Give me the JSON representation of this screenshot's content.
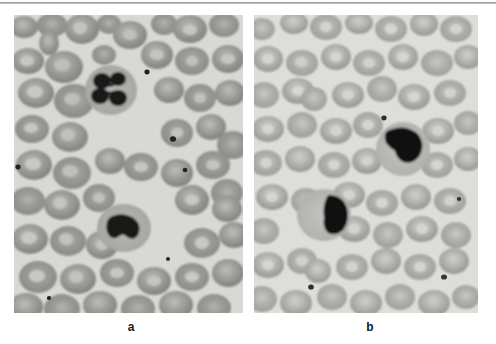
{
  "figure": {
    "name": "blood-smear-figure",
    "type": "two-panel-photomicrograph",
    "divider_rule": true,
    "background_color": "#ffffff",
    "rule_color": "#9a9a9a"
  },
  "panels": [
    {
      "id": "a",
      "caption": "a",
      "label_name": "panel-label-a",
      "subject": "peripheral blood smear",
      "film_background": "#d9d9d6",
      "erythrocyte_color": "#8e8e8e",
      "erythrocyte_pallor_color": "#b9b9b6",
      "nucleus_color": "#1a1a1a",
      "cytoplasm_color": "#b0b0ab",
      "white_cells": [
        {
          "name": "segmented-neutrophil",
          "lobes": 4,
          "cx": 111,
          "cy": 90
        },
        {
          "name": "hyposegmented-neutrophil",
          "lobes": 2,
          "cx": 124,
          "cy": 228
        }
      ]
    },
    {
      "id": "b",
      "caption": "b",
      "label_name": "panel-label-b",
      "subject": "peripheral blood smear",
      "film_background": "#dedeDB",
      "erythrocyte_color": "#a0a09d",
      "erythrocyte_pallor_color": "#c9c9c6",
      "nucleus_color": "#121212",
      "cytoplasm_color": "#bcbcb8",
      "white_cells": [
        {
          "name": "bilobed-neutrophil",
          "lobes": 2,
          "cx": 399,
          "cy": 134
        },
        {
          "name": "pelger-huet-neutrophil",
          "lobes": 2,
          "cx": 325,
          "cy": 214
        }
      ]
    }
  ]
}
